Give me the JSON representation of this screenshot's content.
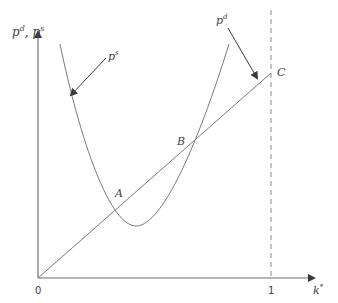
{
  "diagram": {
    "y_axis_label": {
      "base1": "p",
      "sup1": "d",
      "sep": ", ",
      "base2": "p",
      "sup2": "s"
    },
    "x_axis_label": {
      "base": "k",
      "sup": "*"
    },
    "origin_label": "0",
    "x_tick_label": "1",
    "curve_labels": {
      "supply": {
        "base": "p",
        "sup": "s"
      },
      "demand": {
        "base": "p",
        "sup": "d"
      }
    },
    "points": {
      "A": "A",
      "B": "B",
      "C": "C"
    },
    "colors": {
      "line": "#6e6e6e",
      "arrow": "#3a3a3a",
      "text": "#444444"
    }
  }
}
